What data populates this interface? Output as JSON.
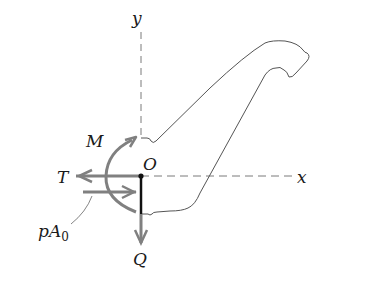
{
  "diagram": {
    "axes": {
      "x_label": "x",
      "y_label": "y",
      "origin_label": "O"
    },
    "forces": {
      "T_label": "T",
      "M_label": "M",
      "Q_label": "Q",
      "pA0_label_main": "pA",
      "pA0_label_sub": "0"
    },
    "colors": {
      "outline": "#555555",
      "arrow_gray": "#808080",
      "axis_dash": "#7a7a7a",
      "section_black": "#111111"
    }
  }
}
